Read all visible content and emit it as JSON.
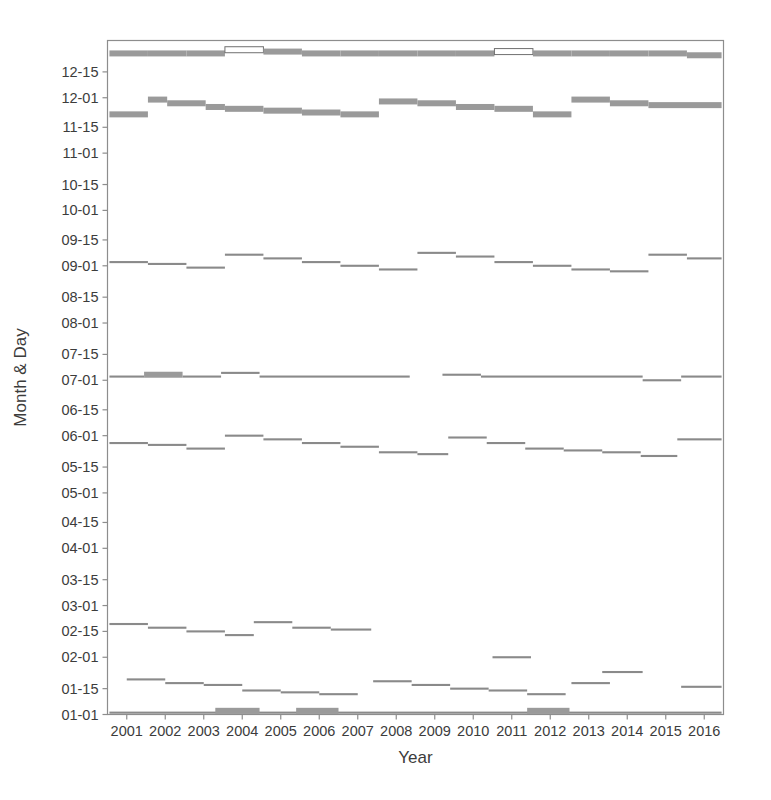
{
  "figure": {
    "background_color": "#ffffff",
    "frame_color": "#8d8d8d",
    "series_color_thin": "#8a8a8a",
    "series_color_thick": "#9a9a9a",
    "width": 771,
    "height": 800
  },
  "chart_data": {
    "type": "line",
    "subtype": "step-segments",
    "title": "",
    "xlabel": "Year",
    "ylabel": "Month & Day",
    "grid": false,
    "legend": null,
    "xlim": [
      2000.5,
      2016.5
    ],
    "ylim_labels": [
      "01-01",
      "12-31"
    ],
    "x_tick_labels": [
      "2001",
      "2002",
      "2003",
      "2004",
      "2005",
      "2006",
      "2007",
      "2008",
      "2009",
      "2010",
      "2011",
      "2012",
      "2013",
      "2014",
      "2015",
      "2016"
    ],
    "y_tick_labels": [
      "01-01",
      "01-15",
      "02-01",
      "02-15",
      "03-01",
      "03-15",
      "04-01",
      "04-15",
      "05-01",
      "05-15",
      "06-01",
      "06-15",
      "07-01",
      "07-15",
      "08-01",
      "08-15",
      "09-01",
      "09-15",
      "10-01",
      "10-15",
      "11-01",
      "11-15",
      "12-01",
      "12-15"
    ],
    "y_tick_day_of_year": [
      1,
      15,
      32,
      46,
      60,
      74,
      91,
      105,
      121,
      135,
      152,
      166,
      182,
      196,
      213,
      227,
      244,
      258,
      274,
      288,
      305,
      319,
      335,
      349
    ],
    "series": [
      {
        "name": "band-12-25",
        "style": "thick",
        "segments": [
          {
            "x0": 2000.55,
            "x1": 2001.55,
            "doy": 359
          },
          {
            "x0": 2001.55,
            "x1": 2002.55,
            "doy": 359
          },
          {
            "x0": 2002.55,
            "x1": 2003.55,
            "doy": 359
          },
          {
            "x0": 2003.55,
            "x1": 2004.55,
            "doy": 361,
            "hollow": true
          },
          {
            "x0": 2004.55,
            "x1": 2005.55,
            "doy": 360
          },
          {
            "x0": 2005.55,
            "x1": 2006.55,
            "doy": 359
          },
          {
            "x0": 2006.55,
            "x1": 2007.55,
            "doy": 359
          },
          {
            "x0": 2007.55,
            "x1": 2008.55,
            "doy": 359
          },
          {
            "x0": 2008.55,
            "x1": 2009.55,
            "doy": 359
          },
          {
            "x0": 2009.55,
            "x1": 2010.55,
            "doy": 359
          },
          {
            "x0": 2010.55,
            "x1": 2011.55,
            "doy": 360,
            "hollow": true
          },
          {
            "x0": 2011.55,
            "x1": 2012.55,
            "doy": 359
          },
          {
            "x0": 2012.55,
            "x1": 2013.55,
            "doy": 359
          },
          {
            "x0": 2013.55,
            "x1": 2014.55,
            "doy": 359
          },
          {
            "x0": 2014.55,
            "x1": 2015.55,
            "doy": 359
          },
          {
            "x0": 2015.55,
            "x1": 2016.45,
            "doy": 358
          }
        ]
      },
      {
        "name": "band-11-20",
        "style": "thick",
        "segments": [
          {
            "x0": 2000.55,
            "x1": 2001.55,
            "doy": 326
          },
          {
            "x0": 2001.55,
            "x1": 2002.05,
            "doy": 334
          },
          {
            "x0": 2002.05,
            "x1": 2003.05,
            "doy": 332
          },
          {
            "x0": 2003.05,
            "x1": 2003.55,
            "doy": 330
          },
          {
            "x0": 2003.55,
            "x1": 2004.55,
            "doy": 329
          },
          {
            "x0": 2004.55,
            "x1": 2005.55,
            "doy": 328
          },
          {
            "x0": 2005.55,
            "x1": 2006.55,
            "doy": 327
          },
          {
            "x0": 2006.55,
            "x1": 2007.55,
            "doy": 326
          },
          {
            "x0": 2007.55,
            "x1": 2008.55,
            "doy": 333
          },
          {
            "x0": 2008.55,
            "x1": 2009.55,
            "doy": 332
          },
          {
            "x0": 2009.55,
            "x1": 2010.55,
            "doy": 330
          },
          {
            "x0": 2010.55,
            "x1": 2011.55,
            "doy": 329
          },
          {
            "x0": 2011.55,
            "x1": 2012.55,
            "doy": 326
          },
          {
            "x0": 2012.55,
            "x1": 2013.55,
            "doy": 334
          },
          {
            "x0": 2013.55,
            "x1": 2014.55,
            "doy": 332
          },
          {
            "x0": 2014.55,
            "x1": 2016.45,
            "doy": 331
          }
        ]
      },
      {
        "name": "band-09-01",
        "style": "thin",
        "segments": [
          {
            "x0": 2000.55,
            "x1": 2001.55,
            "doy": 246
          },
          {
            "x0": 2001.55,
            "x1": 2002.55,
            "doy": 245
          },
          {
            "x0": 2002.55,
            "x1": 2003.55,
            "doy": 243
          },
          {
            "x0": 2003.55,
            "x1": 2004.55,
            "doy": 250
          },
          {
            "x0": 2004.55,
            "x1": 2005.55,
            "doy": 248
          },
          {
            "x0": 2005.55,
            "x1": 2006.55,
            "doy": 246
          },
          {
            "x0": 2006.55,
            "x1": 2007.55,
            "doy": 244
          },
          {
            "x0": 2007.55,
            "x1": 2008.55,
            "doy": 242
          },
          {
            "x0": 2008.55,
            "x1": 2009.55,
            "doy": 251
          },
          {
            "x0": 2009.55,
            "x1": 2010.55,
            "doy": 249
          },
          {
            "x0": 2010.55,
            "x1": 2011.55,
            "doy": 246
          },
          {
            "x0": 2011.55,
            "x1": 2012.55,
            "doy": 244
          },
          {
            "x0": 2012.55,
            "x1": 2013.55,
            "doy": 242
          },
          {
            "x0": 2013.55,
            "x1": 2014.55,
            "doy": 241
          },
          {
            "x0": 2014.55,
            "x1": 2015.55,
            "doy": 250
          },
          {
            "x0": 2015.55,
            "x1": 2016.45,
            "doy": 248
          }
        ]
      },
      {
        "name": "band-07-01",
        "style": "thin",
        "segments": [
          {
            "x0": 2000.55,
            "x1": 2001.45,
            "doy": 184
          },
          {
            "x0": 2001.45,
            "x1": 2002.45,
            "doy": 185,
            "thick": true
          },
          {
            "x0": 2002.45,
            "x1": 2003.45,
            "doy": 184
          },
          {
            "x0": 2003.45,
            "x1": 2004.45,
            "doy": 186
          },
          {
            "x0": 2004.45,
            "x1": 2008.35,
            "doy": 184
          },
          {
            "x0": 2009.2,
            "x1": 2010.2,
            "doy": 185
          },
          {
            "x0": 2010.2,
            "x1": 2014.4,
            "doy": 184
          },
          {
            "x0": 2014.4,
            "x1": 2015.4,
            "doy": 182
          },
          {
            "x0": 2015.4,
            "x1": 2016.45,
            "doy": 184
          }
        ]
      },
      {
        "name": "band-05-28",
        "style": "thin",
        "segments": [
          {
            "x0": 2000.55,
            "x1": 2001.55,
            "doy": 148
          },
          {
            "x0": 2001.55,
            "x1": 2002.55,
            "doy": 147
          },
          {
            "x0": 2002.55,
            "x1": 2003.55,
            "doy": 145
          },
          {
            "x0": 2003.55,
            "x1": 2004.55,
            "doy": 152
          },
          {
            "x0": 2004.55,
            "x1": 2005.55,
            "doy": 150
          },
          {
            "x0": 2005.55,
            "x1": 2006.55,
            "doy": 148
          },
          {
            "x0": 2006.55,
            "x1": 2007.55,
            "doy": 146
          },
          {
            "x0": 2007.55,
            "x1": 2008.55,
            "doy": 143
          },
          {
            "x0": 2008.55,
            "x1": 2009.35,
            "doy": 142
          },
          {
            "x0": 2009.35,
            "x1": 2010.35,
            "doy": 151
          },
          {
            "x0": 2010.35,
            "x1": 2011.35,
            "doy": 148
          },
          {
            "x0": 2011.35,
            "x1": 2012.35,
            "doy": 145
          },
          {
            "x0": 2012.35,
            "x1": 2013.35,
            "doy": 144
          },
          {
            "x0": 2013.35,
            "x1": 2014.35,
            "doy": 143
          },
          {
            "x0": 2014.35,
            "x1": 2015.3,
            "doy": 141
          },
          {
            "x0": 2015.3,
            "x1": 2016.45,
            "doy": 150
          }
        ]
      },
      {
        "name": "band-02-18",
        "style": "thin",
        "segments": [
          {
            "x0": 2000.55,
            "x1": 2001.55,
            "doy": 50
          },
          {
            "x0": 2001.55,
            "x1": 2002.55,
            "doy": 48
          },
          {
            "x0": 2002.55,
            "x1": 2003.55,
            "doy": 46
          },
          {
            "x0": 2003.55,
            "x1": 2004.3,
            "doy": 44
          },
          {
            "x0": 2004.3,
            "x1": 2005.3,
            "doy": 51
          },
          {
            "x0": 2005.3,
            "x1": 2006.3,
            "doy": 48
          },
          {
            "x0": 2006.3,
            "x1": 2007.35,
            "doy": 47
          }
        ]
      },
      {
        "name": "band-01-15",
        "style": "thin",
        "segments": [
          {
            "x0": 2001.0,
            "x1": 2002.0,
            "doy": 20
          },
          {
            "x0": 2002.0,
            "x1": 2003.0,
            "doy": 18
          },
          {
            "x0": 2003.0,
            "x1": 2004.0,
            "doy": 17
          },
          {
            "x0": 2004.0,
            "x1": 2005.0,
            "doy": 14
          },
          {
            "x0": 2005.0,
            "x1": 2006.0,
            "doy": 13
          },
          {
            "x0": 2006.0,
            "x1": 2007.0,
            "doy": 12
          },
          {
            "x0": 2007.4,
            "x1": 2008.4,
            "doy": 19
          },
          {
            "x0": 2008.4,
            "x1": 2009.4,
            "doy": 17
          },
          {
            "x0": 2009.4,
            "x1": 2010.4,
            "doy": 15
          },
          {
            "x0": 2010.4,
            "x1": 2011.4,
            "doy": 14
          },
          {
            "x0": 2011.4,
            "x1": 2012.4,
            "doy": 12
          },
          {
            "x0": 2012.55,
            "x1": 2013.55,
            "doy": 18
          },
          {
            "x0": 2015.4,
            "x1": 2016.45,
            "doy": 16
          }
        ]
      },
      {
        "name": "band-02-01-outlier",
        "style": "thin",
        "segments": [
          {
            "x0": 2010.5,
            "x1": 2011.5,
            "doy": 32
          }
        ]
      },
      {
        "name": "band-01-22-outlier",
        "style": "thin",
        "segments": [
          {
            "x0": 2013.35,
            "x1": 2014.4,
            "doy": 24
          }
        ]
      },
      {
        "name": "band-01-01",
        "style": "thin",
        "segments": [
          {
            "x0": 2000.55,
            "x1": 2016.45,
            "doy": 2
          }
        ]
      },
      {
        "name": "band-01-01-thick-a",
        "style": "thick",
        "segments": [
          {
            "x0": 2003.3,
            "x1": 2004.45,
            "doy": 3
          }
        ]
      },
      {
        "name": "band-01-01-thick-b",
        "style": "thick",
        "segments": [
          {
            "x0": 2005.4,
            "x1": 2006.5,
            "doy": 3
          }
        ]
      },
      {
        "name": "band-01-01-thick-c",
        "style": "thick",
        "segments": [
          {
            "x0": 2011.4,
            "x1": 2012.5,
            "doy": 3
          }
        ]
      }
    ]
  }
}
